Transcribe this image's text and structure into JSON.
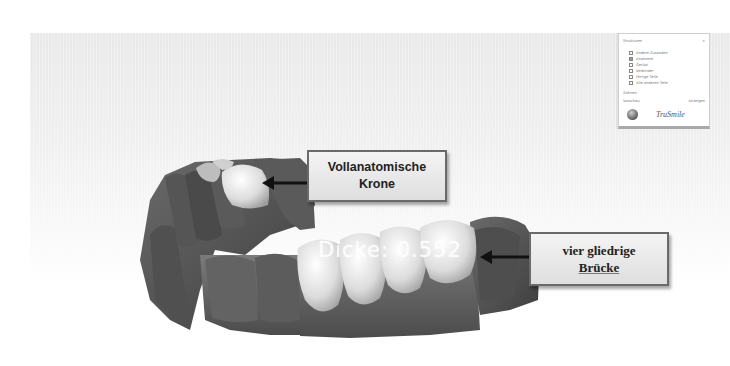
{
  "viewport": {
    "measurement_label": "Dicke: 0.552"
  },
  "callouts": {
    "crown": {
      "line1": "Vollanatomische",
      "line2": "Krone"
    },
    "bridge": {
      "line1": "vier gliedrige",
      "line2": "Brücke"
    }
  },
  "panel": {
    "section_structures": "Strukturen",
    "close_glyph": "×",
    "items": [
      {
        "label": "Andere Zusanden",
        "checked": false
      },
      {
        "label": "Anatomie",
        "checked": true
      },
      {
        "label": "Gerüst",
        "checked": false
      },
      {
        "label": "Verbinder",
        "checked": false
      },
      {
        "label": "Fertige Teile",
        "checked": false
      },
      {
        "label": "Alle anderen Teile",
        "checked": false
      }
    ],
    "section_tools": "Zahnen",
    "toggle_left": "Vorschau",
    "toggle_right": "Anzeigen",
    "brand": "TruSmile"
  },
  "colors": {
    "gingiva": "#5e5e5e",
    "tooth": "#e8e8e8",
    "callout_border": "#6a6a6a",
    "background": "#efefef"
  },
  "icons": {
    "logo": "trusmile-logo-icon",
    "arrow_left": "arrow-left-icon"
  }
}
